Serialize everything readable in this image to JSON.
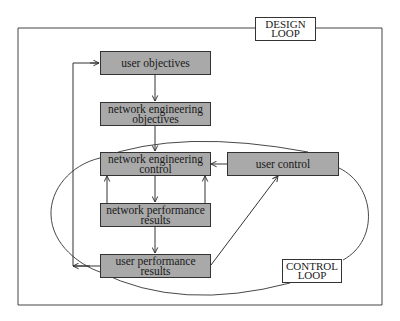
{
  "labels": {
    "design_loop": "DESIGN LOOP",
    "control_loop": "CONTROL LOOP"
  },
  "nodes": {
    "user_objectives": "user objectives",
    "network_engineering_objectives": "network engineering objectives",
    "network_engineering_control": "network engineering control",
    "network_performance_results": "network performance results",
    "user_performance_results": "user performance results",
    "user_control": "user control"
  },
  "edges": [
    {
      "from": "user objectives",
      "to": "network engineering objectives"
    },
    {
      "from": "network engineering objectives",
      "to": "network engineering control"
    },
    {
      "from": "network engineering control",
      "to": "network performance results"
    },
    {
      "from": "network performance results",
      "to": "network engineering control"
    },
    {
      "from": "network performance results",
      "to": "user performance results"
    },
    {
      "from": "user performance results",
      "to": "user control"
    },
    {
      "from": "user control",
      "to": "network engineering control"
    },
    {
      "from": "user performance results",
      "to": "user objectives"
    }
  ],
  "colors": {
    "box_fill": "#a9a9a9",
    "line": "#333333"
  }
}
